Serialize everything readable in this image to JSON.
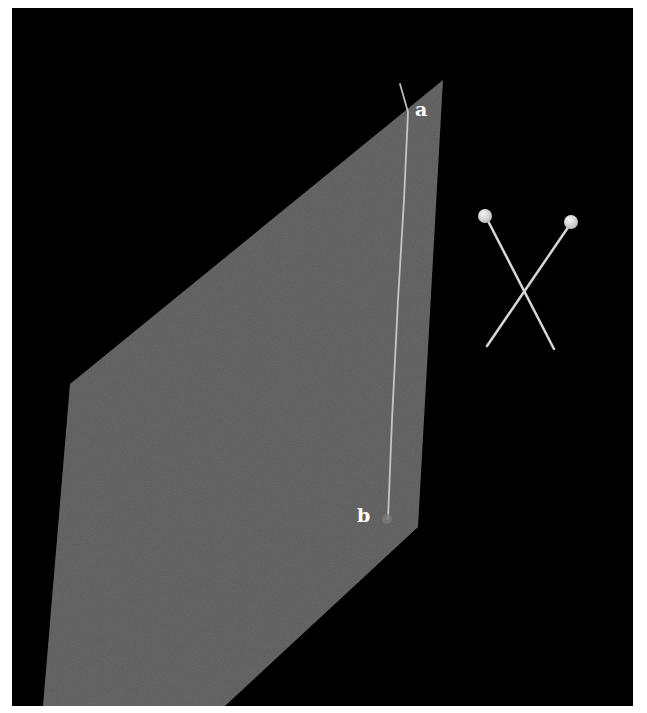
{
  "scene": {
    "background_color": "#000000",
    "page_color": "#ffffff",
    "plane_color": "#5a5a5a",
    "line_color": "#cfcfcf",
    "pin_color": "#d8d8d8",
    "pinhead_color": "#e6e6e6"
  },
  "labels": {
    "point_a": "a",
    "point_b": "b"
  },
  "objects": {
    "plane": "tilted-gray-plane",
    "path": "line-from-a-to-b",
    "crossed_pins": "two-crossed-pins"
  }
}
